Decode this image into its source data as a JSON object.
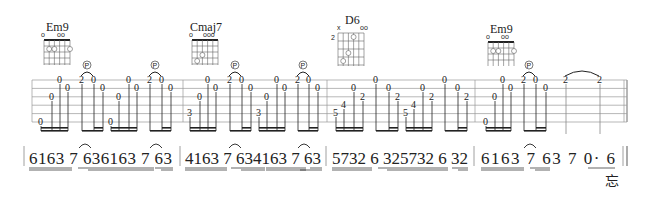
{
  "chords": [
    {
      "name": "Em9",
      "x": 40,
      "markers": "o  oo",
      "top_fret": "",
      "fingers": [
        {
          "s": 1,
          "f": 2,
          "n": "2"
        },
        {
          "s": 2,
          "f": 2,
          "n": "3"
        },
        {
          "s": 5,
          "f": 2,
          "n": "4"
        }
      ]
    },
    {
      "name": "Cmaj7",
      "x": 189,
      "markers": "o  ooo",
      "top_fret": "",
      "fingers": [
        {
          "s": 3,
          "f": 2,
          "n": "2"
        },
        {
          "s": 2,
          "f": 3,
          "n": "3"
        }
      ]
    },
    {
      "name": "D6",
      "x": 336,
      "markers": "x   oo",
      "top_fret": "2",
      "fingers": [
        {
          "s": 4,
          "f": 1,
          "n": "1"
        },
        {
          "s": 3,
          "f": 3,
          "n": "3"
        },
        {
          "s": 2,
          "f": 4,
          "n": "4"
        }
      ]
    },
    {
      "name": "Em9",
      "x": 487,
      "markers": "o  oo",
      "top_fret": "",
      "fingers": [
        {
          "s": 1,
          "f": 2,
          "n": "2"
        },
        {
          "s": 2,
          "f": 2,
          "n": "3"
        },
        {
          "s": 5,
          "f": 2,
          "n": "4"
        }
      ]
    }
  ],
  "technique_labels": {
    "pulloff": "P"
  },
  "tab": {
    "measures": [
      {
        "notes": [
          [
            "0",
            6
          ],
          [
            "0",
            3
          ],
          [
            "0",
            1
          ],
          [
            "0",
            2
          ],
          [
            "2",
            1
          ],
          [
            "0",
            1
          ],
          [
            "0",
            2
          ],
          [
            "0",
            6
          ],
          [
            "0",
            3
          ],
          [
            "0",
            1
          ],
          [
            "0",
            2
          ],
          [
            "2",
            1
          ],
          [
            "0",
            1
          ],
          [
            "0",
            2
          ]
        ]
      },
      {
        "notes": [
          [
            "3",
            5
          ],
          [
            "0",
            3
          ],
          [
            "0",
            1
          ],
          [
            "0",
            2
          ],
          [
            "2",
            1
          ],
          [
            "0",
            1
          ],
          [
            "0",
            2
          ],
          [
            "3",
            5
          ],
          [
            "0",
            3
          ],
          [
            "0",
            1
          ],
          [
            "0",
            2
          ],
          [
            "2",
            1
          ],
          [
            "0",
            1
          ],
          [
            "0",
            2
          ]
        ]
      },
      {
        "notes": [
          [
            "5",
            5
          ],
          [
            "4",
            4
          ],
          [
            "0",
            2
          ],
          [
            "2",
            3
          ],
          [
            "0",
            1
          ],
          [
            "0",
            2
          ],
          [
            "2",
            3
          ],
          [
            "5",
            5
          ],
          [
            "4",
            4
          ],
          [
            "0",
            2
          ],
          [
            "2",
            3
          ],
          [
            "0",
            1
          ],
          [
            "0",
            2
          ],
          [
            "2",
            3
          ]
        ]
      },
      {
        "notes": [
          [
            "0",
            6
          ],
          [
            "0",
            3
          ],
          [
            "0",
            1
          ],
          [
            "0",
            2
          ],
          [
            "2",
            1
          ],
          [
            "0",
            1
          ],
          [
            "0",
            2
          ],
          [
            "2",
            1
          ],
          [
            "2",
            1
          ]
        ]
      }
    ]
  },
  "jianpu": {
    "measures": [
      "6163 7 636163 7 63",
      "4163 7 634163 7 63",
      "5732 6 325732 6 32",
      "6163 7 63  7  0· 6"
    ],
    "lyric": "忘"
  }
}
